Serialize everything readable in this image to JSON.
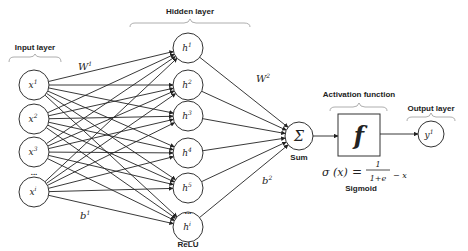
{
  "labels": {
    "input_layer": "Input layer",
    "hidden_layer": "Hidden layer",
    "activation_function": "Activation function",
    "output_layer": "Output layer",
    "relu": "ReLU",
    "sum": "Sum",
    "sigmoid": "Sigmoid"
  },
  "weights": {
    "w1": "W",
    "w1_sup": "1",
    "w2": "W",
    "w2_sup": "2",
    "b1": "b",
    "b1_sup": "1",
    "b2": "b",
    "b2_sup": "2"
  },
  "input_nodes": [
    {
      "base": "x",
      "sup": "1"
    },
    {
      "base": "x",
      "sup": "2"
    },
    {
      "base": "x",
      "sup": "3"
    },
    {
      "base": "x",
      "sup": "i"
    }
  ],
  "hidden_nodes": [
    {
      "base": "h",
      "sup": "1"
    },
    {
      "base": "h",
      "sup": "2"
    },
    {
      "base": "h",
      "sup": "3"
    },
    {
      "base": "h",
      "sup": "4"
    },
    {
      "base": "h",
      "sup": "5"
    },
    {
      "base": "h",
      "sup": "i"
    }
  ],
  "ellipsis": "...",
  "sum_symbol": "Σ",
  "activation_symbol": "f",
  "output_node": {
    "base": "y",
    "sup": "1"
  },
  "formula": {
    "lhs": "σ (x)",
    "equals": "=",
    "numerator": "1",
    "denominator": "1+e",
    "exponent": "− x"
  }
}
